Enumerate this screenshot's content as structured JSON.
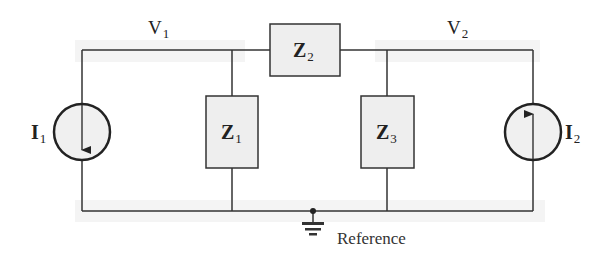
{
  "diagram": {
    "type": "circuit-schematic",
    "nodes": {
      "v1": {
        "label": "V",
        "sub": "1"
      },
      "v2": {
        "label": "V",
        "sub": "2"
      },
      "reference": {
        "label": "Reference"
      }
    },
    "components": {
      "z1": {
        "label": "Z",
        "sub": "1",
        "kind": "impedance"
      },
      "z2": {
        "label": "Z",
        "sub": "2",
        "kind": "impedance"
      },
      "z3": {
        "label": "Z",
        "sub": "3",
        "kind": "impedance"
      },
      "i1": {
        "label": "I",
        "sub": "1",
        "kind": "current-source",
        "direction": "down"
      },
      "i2": {
        "label": "I",
        "sub": "2",
        "kind": "current-source",
        "direction": "up"
      }
    },
    "colors": {
      "wire": "#333333",
      "box_fill": "#eeeeee",
      "source_fill": "#f0f0f0"
    }
  }
}
